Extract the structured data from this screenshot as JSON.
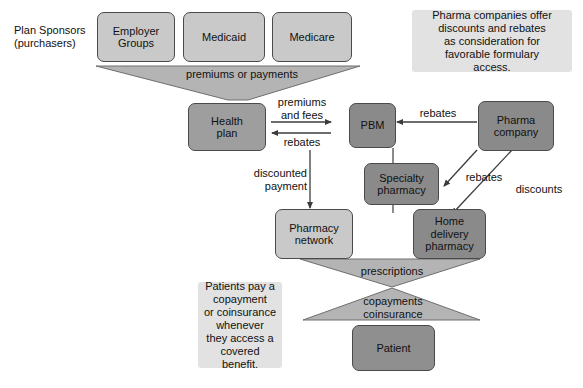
{
  "diagram": {
    "title_caption": "Plan Sponsors\n(purchasers)",
    "nodes": {
      "employer_groups": "Employer\nGroups",
      "medicaid": "Medicaid",
      "medicare": "Medicare",
      "health_plan": "Health\nplan",
      "pbm": "PBM",
      "pharma_company": "Pharma\ncompany",
      "specialty_pharmacy": "Specialty\npharmacy",
      "pharmacy_network": "Pharmacy\nnetwork",
      "home_delivery_pharmacy": "Home\ndelivery\npharmacy",
      "patient": "Patient"
    },
    "notes": {
      "pharma_note": "Pharma companies offer\ndiscounts and rebates\nas consideration for\nfavorable formulary\naccess.",
      "patient_note": "Patients pay a\ncopayment\nor coinsurance\nwhenever\nthey access a\ncovered\nbenefit."
    },
    "flow_labels": {
      "premiums_or_payments": "premiums or payments",
      "premiums_and_fees": "premiums\nand  fees",
      "rebates_hp_pbm": "rebates",
      "rebates_pharma_pbm": "rebates",
      "rebates_pharma_specialty": "rebates",
      "discounts_pharma_home": "discounts",
      "discounted_payment": "discounted\npayment",
      "prescriptions": "prescriptions",
      "copayments_coinsurance": "copayments\ncoinsurance"
    },
    "colors": {
      "light_box": "#c9c9c9",
      "mid_box": "#9e9e9e",
      "dark_box": "#8a8a8a",
      "funnel": "#b4b4b4",
      "note_bg": "#e2e2e2",
      "stroke": "#3c3c3c",
      "background": "#ffffff"
    }
  }
}
